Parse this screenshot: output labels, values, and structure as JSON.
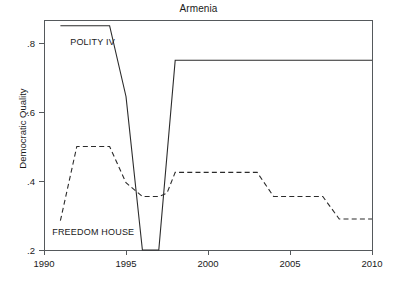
{
  "chart_data": {
    "type": "line",
    "title": "Armenia",
    "xlabel": "",
    "ylabel": "Democratic Quality",
    "xlim": [
      1990,
      2010
    ],
    "ylim": [
      0.18,
      0.875
    ],
    "grid": false,
    "legend": "inline-annotations",
    "xticks": [
      1990,
      1995,
      2000,
      2005,
      2010
    ],
    "xtick_labels": [
      "1990",
      "1995",
      "2000",
      "2005",
      "2010"
    ],
    "yticks": [
      0.2,
      0.4,
      0.6,
      0.8
    ],
    "ytick_labels": [
      ".2",
      ".4",
      ".6",
      ".8"
    ],
    "series": [
      {
        "name": "POLITY IV",
        "style": "solid",
        "label_text": "POLITY IV",
        "x": [
          1991,
          1994,
          1995,
          1996,
          1997,
          1998,
          2010
        ],
        "values": [
          0.85,
          0.85,
          0.645,
          0.2,
          0.2,
          0.75,
          0.75
        ]
      },
      {
        "name": "FREEDOM HOUSE",
        "style": "dashed",
        "label_text": "FREEDOM HOUSE",
        "x": [
          1991,
          1992,
          1994,
          1995,
          1996,
          1997,
          1997.5,
          1998,
          2003,
          2004,
          2007,
          2008,
          2010
        ],
        "values": [
          0.285,
          0.5,
          0.5,
          0.395,
          0.355,
          0.355,
          0.365,
          0.425,
          0.425,
          0.355,
          0.355,
          0.29,
          0.29
        ]
      }
    ],
    "annotations": [
      {
        "text": "POLITY IV",
        "x": 1991.6,
        "y": 0.795
      },
      {
        "text": "FREEDOM HOUSE",
        "x": 1990.5,
        "y": 0.245
      }
    ],
    "colors": {
      "line": "#2b2b2b",
      "axis": "#55595c",
      "text": "#1a1a1a",
      "background": "#ffffff"
    }
  }
}
